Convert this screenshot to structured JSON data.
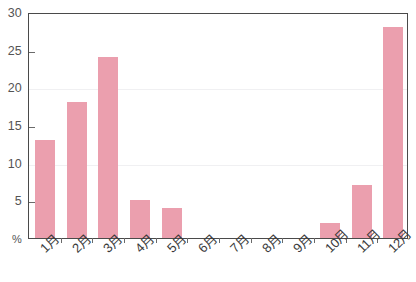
{
  "chart_data": {
    "type": "bar",
    "title": "",
    "subtitle": "",
    "xlabel": "",
    "ylabel": "%",
    "categories": [
      "1月",
      "2月",
      "3月",
      "4月",
      "5月",
      "6月",
      "7月",
      "8月",
      "9月",
      "10月",
      "11月",
      "12月"
    ],
    "values": [
      13,
      18,
      24,
      5,
      4,
      0,
      0,
      0,
      0,
      2,
      7,
      28
    ],
    "ylim": [
      0,
      30
    ],
    "ytick_values": [
      0,
      5,
      10,
      15,
      20,
      25,
      30
    ],
    "ytick_labels": [
      "%",
      "5",
      "10",
      "15",
      "20",
      "25",
      "30"
    ],
    "gridlines_at": [
      10,
      20
    ],
    "grid": true,
    "legend": null,
    "legend_position": "none",
    "bar_color": "#eb9fae",
    "axis_color": "#4a4a4a",
    "grid_color": "#f0f0f2",
    "tick_label_color": "#545454",
    "background": "#ffffff"
  }
}
